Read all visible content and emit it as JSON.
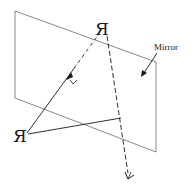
{
  "diagram": {
    "labels": {
      "mirror": "Mirror"
    },
    "objects": {
      "image_glyph": "Я",
      "object_glyph": "Я"
    },
    "icons": {
      "eye": "eye-icon"
    },
    "colors": {
      "line": "#1a1a1a",
      "mirror_edge": "#6a6a6a",
      "background": "#ffffff"
    }
  }
}
